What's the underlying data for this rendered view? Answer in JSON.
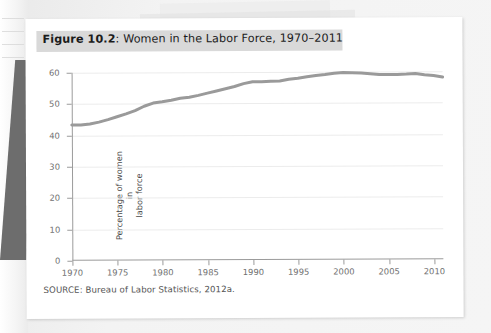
{
  "figure": {
    "label_number": "Figure 10.2",
    "label_separator": ":",
    "title": " Women in the Labor Force, 1970–2011",
    "source": "SOURCE: Bureau of Labor Statistics, 2012a."
  },
  "chart_data": {
    "type": "line",
    "title": "Figure 10.2: Women in the Labor Force, 1970–2011",
    "xlabel": "",
    "ylabel": "Percentage of women in labor force",
    "ylabel_line1": "Percentage of women in",
    "ylabel_line2": "labor force",
    "xlim": [
      1970,
      2011
    ],
    "ylim": [
      0,
      60
    ],
    "yticks": [
      0,
      10,
      20,
      30,
      40,
      50,
      60
    ],
    "ytick_labels": [
      "0",
      "10",
      "20",
      "30",
      "40",
      "50",
      "60"
    ],
    "xticks": [
      1970,
      1975,
      1980,
      1985,
      1990,
      1995,
      2000,
      2005,
      2010
    ],
    "xtick_labels": [
      "1970",
      "1975",
      "1980",
      "1985",
      "1990",
      "1995",
      "2000",
      "2005",
      "2010"
    ],
    "grid": true,
    "grid_axis": "y",
    "legend": false,
    "line_color": "#9a9a9a",
    "line_width": 3,
    "series": [
      {
        "name": "Percentage of women in labor force",
        "x": [
          1970,
          1971,
          1972,
          1973,
          1974,
          1975,
          1976,
          1977,
          1978,
          1979,
          1980,
          1981,
          1982,
          1983,
          1984,
          1985,
          1986,
          1987,
          1988,
          1989,
          1990,
          1991,
          1992,
          1993,
          1994,
          1995,
          1996,
          1997,
          1998,
          1999,
          2000,
          2001,
          2002,
          2003,
          2004,
          2005,
          2006,
          2007,
          2008,
          2009,
          2010,
          2011
        ],
        "values": [
          43.3,
          43.3,
          43.6,
          44.2,
          45.0,
          45.9,
          46.8,
          47.8,
          49.2,
          50.2,
          50.6,
          51.1,
          51.7,
          52.0,
          52.6,
          53.3,
          54.0,
          54.7,
          55.4,
          56.3,
          56.9,
          56.9,
          57.0,
          57.1,
          57.6,
          57.9,
          58.4,
          58.8,
          59.1,
          59.5,
          59.7,
          59.6,
          59.5,
          59.3,
          59.0,
          59.0,
          59.0,
          59.1,
          59.3,
          58.9,
          58.6,
          58.1
        ]
      }
    ]
  }
}
